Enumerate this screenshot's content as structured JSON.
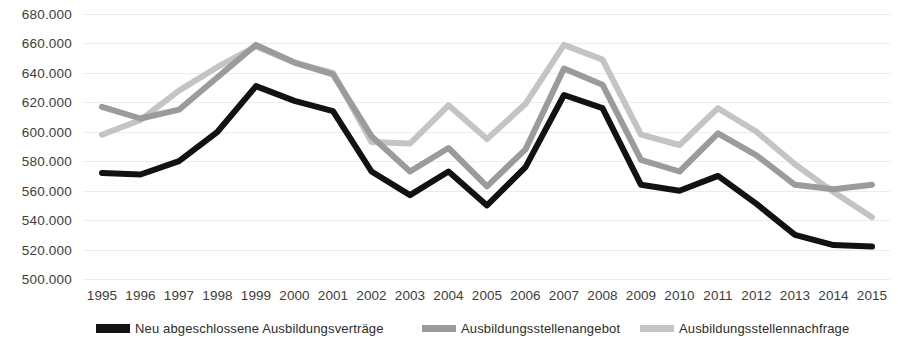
{
  "chart_data": {
    "type": "line",
    "title": "",
    "subtitle": "",
    "xlabel": "",
    "ylabel": "",
    "grid": true,
    "legend_position": "bottom",
    "ylim": [
      500000,
      680000
    ],
    "ytick_step": 20000,
    "ytick_labels": [
      "680.000",
      "660.000",
      "640.000",
      "620.000",
      "600.000",
      "580.000",
      "560.000",
      "540.000",
      "520.000",
      "500.000"
    ],
    "ytick_values": [
      680000,
      660000,
      640000,
      620000,
      600000,
      580000,
      560000,
      540000,
      520000,
      500000
    ],
    "categories": [
      "1995",
      "1996",
      "1997",
      "1998",
      "1999",
      "2000",
      "2001",
      "2002",
      "2003",
      "2004",
      "2005",
      "2006",
      "2007",
      "2008",
      "2009",
      "2010",
      "2011",
      "2012",
      "2013",
      "2014",
      "2015"
    ],
    "x": [
      1995,
      1996,
      1997,
      1998,
      1999,
      2000,
      2001,
      2002,
      2003,
      2004,
      2005,
      2006,
      2007,
      2008,
      2009,
      2010,
      2011,
      2012,
      2013,
      2014,
      2015
    ],
    "series": [
      {
        "name": "Neu abgeschlossene Ausbildungsverträge",
        "color": "#121212",
        "width": 6,
        "values": [
          572000,
          571000,
          580000,
          600000,
          631000,
          621000,
          614000,
          573000,
          557000,
          573000,
          550000,
          576000,
          625000,
          616000,
          564000,
          560000,
          570000,
          551000,
          530000,
          523000,
          522000
        ]
      },
      {
        "name": "Ausbildungsstellenangebot",
        "color": "#9b9b9b",
        "width": 6,
        "values": [
          617000,
          609000,
          615000,
          637000,
          659000,
          647000,
          639000,
          597000,
          573000,
          589000,
          563000,
          588000,
          643000,
          632000,
          581000,
          573000,
          599000,
          584000,
          564000,
          561000,
          564000
        ]
      },
      {
        "name": "Ausbildungsstellennachfrage",
        "color": "#c4c4c4",
        "width": 6,
        "values": [
          598000,
          608000,
          628000,
          644000,
          658000,
          647000,
          640000,
          593000,
          592000,
          618000,
          595000,
          619000,
          659000,
          649000,
          598000,
          591000,
          616000,
          600000,
          578000,
          559000,
          542000
        ]
      }
    ]
  },
  "y_axis": {
    "labels": [
      "680.000",
      "660.000",
      "640.000",
      "620.000",
      "600.000",
      "580.000",
      "560.000",
      "540.000",
      "520.000",
      "500.000"
    ]
  },
  "x_axis": {
    "labels": [
      "1995",
      "1996",
      "1997",
      "1998",
      "1999",
      "2000",
      "2001",
      "2002",
      "2003",
      "2004",
      "2005",
      "2006",
      "2007",
      "2008",
      "2009",
      "2010",
      "2011",
      "2012",
      "2013",
      "2014",
      "2015"
    ]
  },
  "legend": {
    "items": [
      {
        "label": "Neu abgeschlossene Ausbildungsverträge",
        "color": "#121212"
      },
      {
        "label": "Ausbildungsstellenangebot",
        "color": "#9b9b9b"
      },
      {
        "label": "Ausbildungsstellennachfrage",
        "color": "#c4c4c4"
      }
    ]
  }
}
